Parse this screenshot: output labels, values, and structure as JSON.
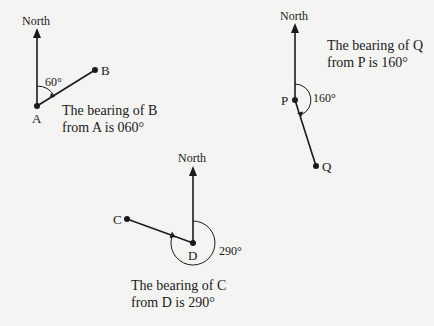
{
  "diagrams": [
    {
      "id": "A-B",
      "north_label": "North",
      "from_point": "A",
      "to_point": "B",
      "angle_label": "60°",
      "caption_lines": [
        "The bearing of B",
        "from A is 060°"
      ]
    },
    {
      "id": "P-Q",
      "north_label": "North",
      "from_point": "P",
      "to_point": "Q",
      "angle_label": "160°",
      "caption_lines": [
        "The bearing of Q",
        "from P is 160°"
      ]
    },
    {
      "id": "D-C",
      "north_label": "North",
      "from_point": "D",
      "to_point": "C",
      "angle_label": "290°",
      "caption_lines": [
        "The bearing of C",
        "from D is 290°"
      ]
    }
  ],
  "colors": {
    "ink": "#1a1a1a",
    "paper": "#f4f4f2"
  }
}
